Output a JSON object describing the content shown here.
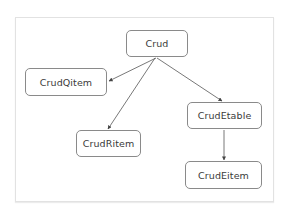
{
  "diagram": {
    "type": "tree",
    "colors": {
      "node_border": "#8a8a8a",
      "edge": "#444444",
      "text": "#3a3a3a",
      "frame": "#e2e2e2"
    },
    "nodes": [
      {
        "id": "crud",
        "label": "Crud"
      },
      {
        "id": "qitem",
        "label": "CrudQitem"
      },
      {
        "id": "ritem",
        "label": "CrudRitem"
      },
      {
        "id": "etable",
        "label": "CrudEtable"
      },
      {
        "id": "eitem",
        "label": "CrudEitem"
      }
    ],
    "edges": [
      {
        "from": "Crud",
        "to": "CrudQitem"
      },
      {
        "from": "Crud",
        "to": "CrudRitem"
      },
      {
        "from": "Crud",
        "to": "CrudEtable"
      },
      {
        "from": "CrudEtable",
        "to": "CrudEitem"
      }
    ]
  }
}
